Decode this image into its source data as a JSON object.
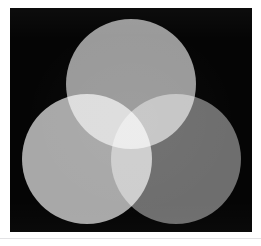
{
  "figure": {
    "canvas": {
      "width": 261,
      "height": 246,
      "page_background": "#ffffff"
    },
    "panel": {
      "name": "black-field",
      "background": "#050505",
      "x": 10,
      "y": 8,
      "width": 242,
      "height": 224
    },
    "footer_rule": {
      "color": "#e2e2e4",
      "y": 238
    }
  },
  "chart_data": {
    "type": "venn",
    "subtitle": "",
    "xlabel": "",
    "ylabel": "",
    "legend_position": "none",
    "grid": false,
    "background": "#050505",
    "set_count": 3,
    "blend_mode": "screen",
    "circle_diameter": 131,
    "sets": [
      {
        "id": "top",
        "label": "Upper circle",
        "role": "primary-light-1",
        "center_x": 131,
        "center_y": 84,
        "radius": 65,
        "rendered_gray": "#9a9a9a",
        "fill": "#9a9a9a"
      },
      {
        "id": "bottom-left",
        "label": "Lower-left circle",
        "role": "primary-light-2",
        "center_x": 87,
        "center_y": 159,
        "radius": 65,
        "rendered_gray": "#a8a8a8",
        "fill": "#a8a8a8"
      },
      {
        "id": "bottom-right",
        "label": "Lower-right circle",
        "role": "primary-light-3",
        "center_x": 176,
        "center_y": 159,
        "radius": 65,
        "rendered_gray": "#6e6e6e",
        "fill": "#6e6e6e"
      }
    ],
    "intersections": [
      {
        "id": "top-and-bottom-left",
        "label": "Upper + lower-left",
        "sets": [
          "top",
          "bottom-left"
        ],
        "rendered_gray": "#ececed"
      },
      {
        "id": "top-and-bottom-right",
        "label": "Upper + lower-right",
        "sets": [
          "top",
          "bottom-right"
        ],
        "rendered_gray": "#8b8b8b"
      },
      {
        "id": "bottom-left-and-bottom-right",
        "label": "Lower-left + lower-right",
        "sets": [
          "bottom-left",
          "bottom-right"
        ],
        "rendered_gray": "#d9d9da"
      },
      {
        "id": "all-three",
        "label": "All three circles",
        "sets": [
          "top",
          "bottom-left",
          "bottom-right"
        ],
        "rendered_gray": "#ffffff"
      }
    ],
    "annotations": []
  }
}
